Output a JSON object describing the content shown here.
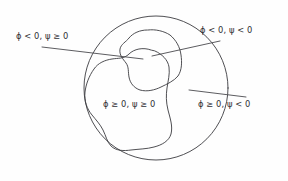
{
  "figure": {
    "background_color": "#fefefe",
    "stroke_color": "#3b3b3f",
    "text_color": "#2f2f33"
  },
  "labels": [
    {
      "id": "phi-neg-psi-nonneg",
      "text": "ϕ < 0, ψ ≥ 0",
      "x": 16,
      "y": 36,
      "region": "outside-phi-blob inside-psi-blob"
    },
    {
      "id": "phi-neg-psi-neg",
      "text": "ϕ < 0, ψ < 0",
      "x": 200,
      "y": 30,
      "region": "outside-both-blobs"
    },
    {
      "id": "phi-nonneg-psi-nonneg",
      "text": "ϕ ≥ 0, ψ ≥ 0",
      "x": 103,
      "y": 104,
      "region": "inside-phi-blob inside-psi-region"
    },
    {
      "id": "phi-nonneg-psi-neg",
      "text": "ϕ ≥ 0, ψ < 0",
      "x": 198,
      "y": 104,
      "region": "inside-phi-region outside-psi-blob"
    }
  ],
  "geometry": {
    "circle": {
      "cx": 156,
      "cy": 88,
      "r": 72
    },
    "leader_lines": [
      {
        "id": "leader-upper-left",
        "from_x": 42,
        "from_y": 47,
        "to_x": 143,
        "to_y": 59
      },
      {
        "id": "leader-upper-right",
        "from_x": 220,
        "from_y": 41,
        "to_x": 152,
        "to_y": 56
      },
      {
        "id": "leader-lower-right",
        "from_x": 246,
        "from_y": 97,
        "to_x": 189,
        "to_y": 90
      }
    ],
    "blobs": [
      {
        "id": "psi-blob",
        "label": "psi zero level set",
        "bbox": [
          120,
          29,
          182,
          91
        ]
      },
      {
        "id": "phi-blob",
        "label": "phi zero level set",
        "bbox": [
          84,
          49,
          172,
          151
        ]
      }
    ]
  }
}
